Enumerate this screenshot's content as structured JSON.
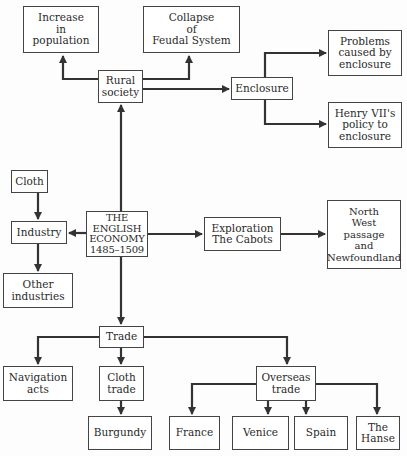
{
  "diagram": {
    "title": "THE ENGLISH ECONOMY 1485–1509",
    "nodes": {
      "center": {
        "label": "THE\nENGLISH\nECONOMY\n1485–1509"
      },
      "rural_society": {
        "label": "Rural\nsociety"
      },
      "increase_population": {
        "label": "Increase\nin\npopulation"
      },
      "collapse_feudal": {
        "label": "Collapse\nof\nFeudal System"
      },
      "enclosure": {
        "label": "Enclosure"
      },
      "problems_enclosure": {
        "label": "Problems\ncaused by\nenclosure"
      },
      "henry_policy": {
        "label": "Henry VII's\npolicy to\nenclosure"
      },
      "industry": {
        "label": "Industry"
      },
      "cloth": {
        "label": "Cloth"
      },
      "other_industries": {
        "label": "Other\nindustries"
      },
      "exploration": {
        "label": "Exploration\nThe Cabots"
      },
      "north_west": {
        "label": "North\nWest\npassage\nand\nNewfoundland"
      },
      "trade": {
        "label": "Trade"
      },
      "navigation_acts": {
        "label": "Navigation\nacts"
      },
      "cloth_trade": {
        "label": "Cloth\ntrade"
      },
      "burgundy": {
        "label": "Burgundy"
      },
      "overseas_trade": {
        "label": "Overseas\ntrade"
      },
      "france": {
        "label": "France"
      },
      "venice": {
        "label": "Venice"
      },
      "spain": {
        "label": "Spain"
      },
      "hanse": {
        "label": "The\nHanse"
      }
    },
    "edges": [
      {
        "from": "center",
        "to": "rural_society"
      },
      {
        "from": "rural_society",
        "to": "increase_population"
      },
      {
        "from": "rural_society",
        "to": "collapse_feudal"
      },
      {
        "from": "rural_society",
        "to": "enclosure"
      },
      {
        "from": "enclosure",
        "to": "problems_enclosure"
      },
      {
        "from": "enclosure",
        "to": "henry_policy"
      },
      {
        "from": "center",
        "to": "industry"
      },
      {
        "from": "cloth",
        "to": "industry"
      },
      {
        "from": "industry",
        "to": "other_industries"
      },
      {
        "from": "center",
        "to": "exploration"
      },
      {
        "from": "exploration",
        "to": "north_west"
      },
      {
        "from": "center",
        "to": "trade"
      },
      {
        "from": "trade",
        "to": "navigation_acts"
      },
      {
        "from": "trade",
        "to": "cloth_trade"
      },
      {
        "from": "cloth_trade",
        "to": "burgundy"
      },
      {
        "from": "trade",
        "to": "overseas_trade"
      },
      {
        "from": "overseas_trade",
        "to": "france"
      },
      {
        "from": "overseas_trade",
        "to": "venice"
      },
      {
        "from": "overseas_trade",
        "to": "spain"
      },
      {
        "from": "overseas_trade",
        "to": "hanse"
      }
    ],
    "colors": {
      "line": "#333333",
      "border": "#444444",
      "background": "#fdfdfd"
    }
  }
}
